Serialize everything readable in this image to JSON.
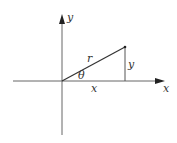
{
  "diagram": {
    "labels": {
      "y_axis": "y",
      "x_axis": "x",
      "radius": "r",
      "angle": "θ",
      "opposite": "y",
      "adjacent": "x"
    },
    "colors": {
      "axis": "#666666",
      "line": "#333333",
      "text": "#333333"
    },
    "geometry": {
      "origin": [
        62,
        81
      ],
      "point": [
        125,
        47
      ],
      "x_axis_range": [
        13,
        165
      ],
      "y_axis_range": [
        16,
        135
      ]
    }
  }
}
